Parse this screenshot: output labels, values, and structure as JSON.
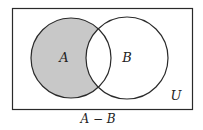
{
  "diagram": {
    "type": "venn",
    "universe_label": "U",
    "sets": [
      {
        "label": "A",
        "shaded": true
      },
      {
        "label": "B",
        "shaded": false
      }
    ],
    "caption": "A − B",
    "shaded_region": "A minus B",
    "colors": {
      "shade": "#c8c8c8",
      "stroke": "#2a2a2a",
      "background": "#ffffff"
    }
  }
}
